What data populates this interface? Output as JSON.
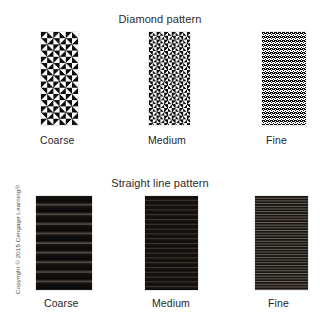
{
  "figure": {
    "background_color": "#ffffff",
    "copyright": "Copyright © 2015 Cengage Learning®"
  },
  "sections": [
    {
      "title": "Diamond pattern",
      "swatches": [
        {
          "label": "Coarse",
          "pattern": "diamond",
          "grade": "coarse"
        },
        {
          "label": "Medium",
          "pattern": "diamond",
          "grade": "medium"
        },
        {
          "label": "Fine",
          "pattern": "diamond",
          "grade": "fine"
        }
      ]
    },
    {
      "title": "Straight line pattern",
      "swatches": [
        {
          "label": "Coarse",
          "pattern": "straight-line",
          "grade": "coarse"
        },
        {
          "label": "Medium",
          "pattern": "straight-line",
          "grade": "medium"
        },
        {
          "label": "Fine",
          "pattern": "straight-line",
          "grade": "fine"
        }
      ]
    }
  ],
  "colors": {
    "pattern_dark": "#0d0d0d",
    "pattern_light": "#ffffff",
    "text": "#262626",
    "background": "#ffffff"
  }
}
